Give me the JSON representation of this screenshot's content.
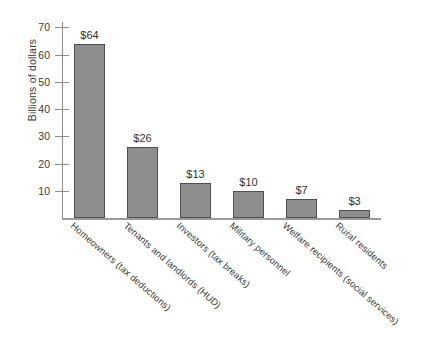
{
  "chart_data": {
    "type": "bar",
    "title": "",
    "subtitle": "",
    "xlabel": "",
    "ylabel": "Billions of dollars",
    "ylim": [
      0,
      72
    ],
    "yticks": [
      10,
      20,
      30,
      40,
      50,
      60,
      70
    ],
    "ytick_labels": [
      "10",
      "20",
      "30",
      "40",
      "50",
      "60",
      "70"
    ],
    "grid": false,
    "legend": false,
    "bar_color": "#8e8e8e",
    "bar_edge_color": "#4f4f4f",
    "axis_color": "#8d8d8d",
    "background": "#ffffff",
    "categories": [
      "Homeowners (tax deductions)",
      "Tenants and landlords (HUD)",
      "Investors (tax breaks)",
      "Military personnel",
      "Welfare recipients (social services)",
      "Rural residents"
    ],
    "values": [
      64,
      26,
      13,
      10,
      7,
      3
    ],
    "value_labels": [
      "$64",
      "$26",
      "$13",
      "$10",
      "$7",
      "$3"
    ]
  }
}
